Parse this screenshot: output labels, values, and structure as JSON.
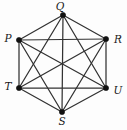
{
  "figure": {
    "kind": "graph-diagram",
    "background_color": "#fdfdfd",
    "edge_color": "#323232",
    "vertex_color": "#111111",
    "label_color": "#1a1a1a"
  },
  "chart_data": {
    "type": "scatter",
    "title": "",
    "xlabel": "",
    "ylabel": "",
    "grid": false,
    "legend": "none",
    "graph_type": "complete-graph-K6",
    "vertex_count": 6,
    "edge_count": 15,
    "nodes": [
      {
        "id": "Q",
        "label": "Q",
        "x": 63,
        "y": 15,
        "label_x": 60,
        "label_y": 7,
        "label_anchor": "middle"
      },
      {
        "id": "P",
        "label": "P",
        "x": 19,
        "y": 40,
        "label_x": 8,
        "label_y": 39,
        "label_anchor": "middle"
      },
      {
        "id": "R",
        "label": "R",
        "x": 106,
        "y": 39,
        "label_x": 118,
        "label_y": 40,
        "label_anchor": "middle"
      },
      {
        "id": "T",
        "label": "T",
        "x": 19,
        "y": 88,
        "label_x": 8,
        "label_y": 87,
        "label_anchor": "middle"
      },
      {
        "id": "U",
        "label": "U",
        "x": 106,
        "y": 88,
        "label_x": 118,
        "label_y": 91,
        "label_anchor": "middle"
      },
      {
        "id": "S",
        "label": "S",
        "x": 62,
        "y": 112,
        "label_x": 62,
        "label_y": 122,
        "label_anchor": "middle"
      }
    ],
    "edges": [
      {
        "from": "P",
        "to": "Q"
      },
      {
        "from": "P",
        "to": "R"
      },
      {
        "from": "P",
        "to": "S"
      },
      {
        "from": "P",
        "to": "T"
      },
      {
        "from": "P",
        "to": "U"
      },
      {
        "from": "Q",
        "to": "R"
      },
      {
        "from": "Q",
        "to": "S"
      },
      {
        "from": "Q",
        "to": "T"
      },
      {
        "from": "Q",
        "to": "U"
      },
      {
        "from": "R",
        "to": "S"
      },
      {
        "from": "R",
        "to": "T"
      },
      {
        "from": "R",
        "to": "U"
      },
      {
        "from": "S",
        "to": "T"
      },
      {
        "from": "S",
        "to": "U"
      },
      {
        "from": "T",
        "to": "U"
      }
    ]
  }
}
